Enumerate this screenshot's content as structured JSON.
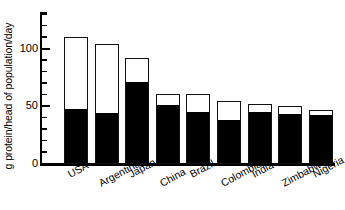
{
  "chart_data": {
    "type": "bar",
    "subtype": "stacked",
    "title": "",
    "xlabel": "",
    "ylabel": "g protein/head of population/day",
    "ylim": [
      0,
      132
    ],
    "yticks_major": [
      0,
      50,
      100
    ],
    "yticks_major_labels": [
      "0",
      "50",
      "100"
    ],
    "yticks_minor": [
      10,
      20,
      30,
      40,
      60,
      70,
      80,
      90,
      110,
      120,
      130
    ],
    "grid": false,
    "legend": null,
    "legend_position": "none",
    "categories": [
      "USA",
      "Argentina",
      "Japan",
      "China",
      "Brazil",
      "Colombia",
      "India",
      "Zimbabwe",
      "Nigeria"
    ],
    "series": [
      {
        "name": "plant protein",
        "fill": "black",
        "values": [
          48,
          45,
          72,
          52,
          46,
          39,
          46,
          44,
          43
        ]
      },
      {
        "name": "animal protein",
        "fill": "white",
        "values": [
          62,
          59,
          20,
          9,
          15,
          16,
          6,
          6,
          4
        ]
      }
    ],
    "totals": [
      110,
      104,
      92,
      61,
      61,
      55,
      52,
      50,
      47
    ]
  },
  "axis": {
    "y_title": "g protein/head of population/day",
    "tick_labels": [
      {
        "value": 100,
        "text": "100"
      },
      {
        "value": 50,
        "text": "50"
      },
      {
        "value": 0,
        "text": "0"
      }
    ]
  },
  "colors": {
    "bar_fill": "#000000",
    "bar_empty": "#ffffff",
    "bar_stroke": "#111111",
    "axis": "#000000",
    "background": "#ffffff"
  }
}
